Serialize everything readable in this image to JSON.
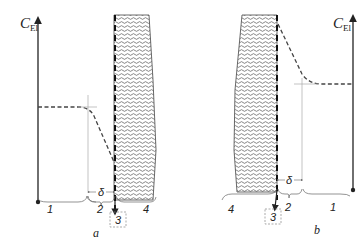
{
  "panels": [
    {
      "id": "a",
      "caption": "a",
      "axis_label_main": "C",
      "axis_label_sub": "El",
      "delta_label": "δ",
      "region_labels": [
        "1",
        "2",
        "3",
        "4"
      ]
    },
    {
      "id": "b",
      "caption": "b",
      "axis_label_main": "C",
      "axis_label_sub": "El",
      "delta_label": "δ",
      "region_labels": [
        "4",
        "3",
        "2",
        "1"
      ]
    }
  ],
  "colors": {
    "line": "#222222",
    "hatch": "#555555",
    "thin": "#aaaaaa",
    "box": "#888888"
  }
}
